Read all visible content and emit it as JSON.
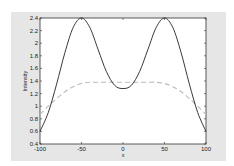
{
  "chart_data": {
    "type": "line",
    "title": "",
    "xlabel": "x",
    "ylabel": "Intensity",
    "xlim": [
      -100,
      100
    ],
    "ylim": [
      0.4,
      2.4
    ],
    "xticks": [
      -100,
      -50,
      0,
      50,
      100
    ],
    "yticks": [
      0.4,
      0.6,
      0.8,
      1,
      1.2,
      1.4,
      1.6,
      1.8,
      2,
      2.2,
      2.4
    ],
    "grid": false,
    "legend": null,
    "series": [
      {
        "name": "solid",
        "style": "solid",
        "color": "#222222",
        "x": [
          -100,
          -90,
          -80,
          -70,
          -60,
          -50,
          -40,
          -30,
          -20,
          -10,
          0,
          10,
          20,
          30,
          40,
          50,
          60,
          70,
          80,
          90,
          100
        ],
        "y": [
          0.6,
          0.9,
          1.35,
          1.85,
          2.25,
          2.4,
          2.25,
          1.9,
          1.55,
          1.33,
          1.28,
          1.33,
          1.55,
          1.9,
          2.25,
          2.4,
          2.25,
          1.85,
          1.35,
          0.9,
          0.6
        ]
      },
      {
        "name": "dashed",
        "style": "dashed",
        "color": "#bbbbbb",
        "x": [
          -100,
          -90,
          -80,
          -70,
          -60,
          -50,
          -40,
          -30,
          -20,
          -10,
          0,
          10,
          20,
          30,
          40,
          50,
          60,
          70,
          80,
          90,
          100
        ],
        "y": [
          0.87,
          1.0,
          1.12,
          1.23,
          1.31,
          1.36,
          1.38,
          1.38,
          1.38,
          1.38,
          1.38,
          1.38,
          1.38,
          1.38,
          1.38,
          1.36,
          1.31,
          1.23,
          1.12,
          1.0,
          0.87
        ]
      }
    ]
  }
}
